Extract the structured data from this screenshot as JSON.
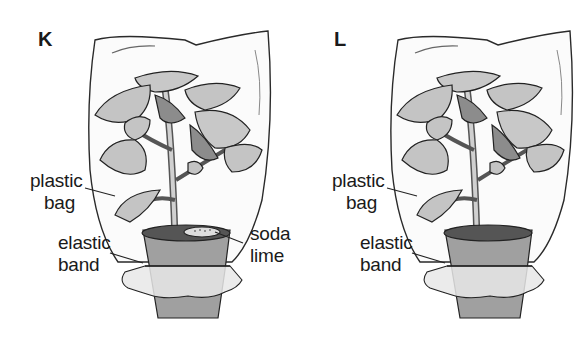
{
  "diagram": {
    "colors": {
      "leaf": "#c4c4c4",
      "leaf_dark": "#8c8c8c",
      "pot": "#9a9a9a",
      "soil": "#5a5a5a",
      "outline": "#222222"
    },
    "panels": [
      {
        "id": "K",
        "letter": "K",
        "labels": {
          "plastic_bag": [
            "plastic",
            "bag"
          ],
          "elastic_band": [
            "elastic",
            "band"
          ],
          "soda_lime": [
            "soda",
            "lime"
          ]
        }
      },
      {
        "id": "L",
        "letter": "L",
        "labels": {
          "plastic_bag": [
            "plastic",
            "bag"
          ],
          "elastic_band": [
            "elastic",
            "band"
          ]
        }
      }
    ]
  }
}
